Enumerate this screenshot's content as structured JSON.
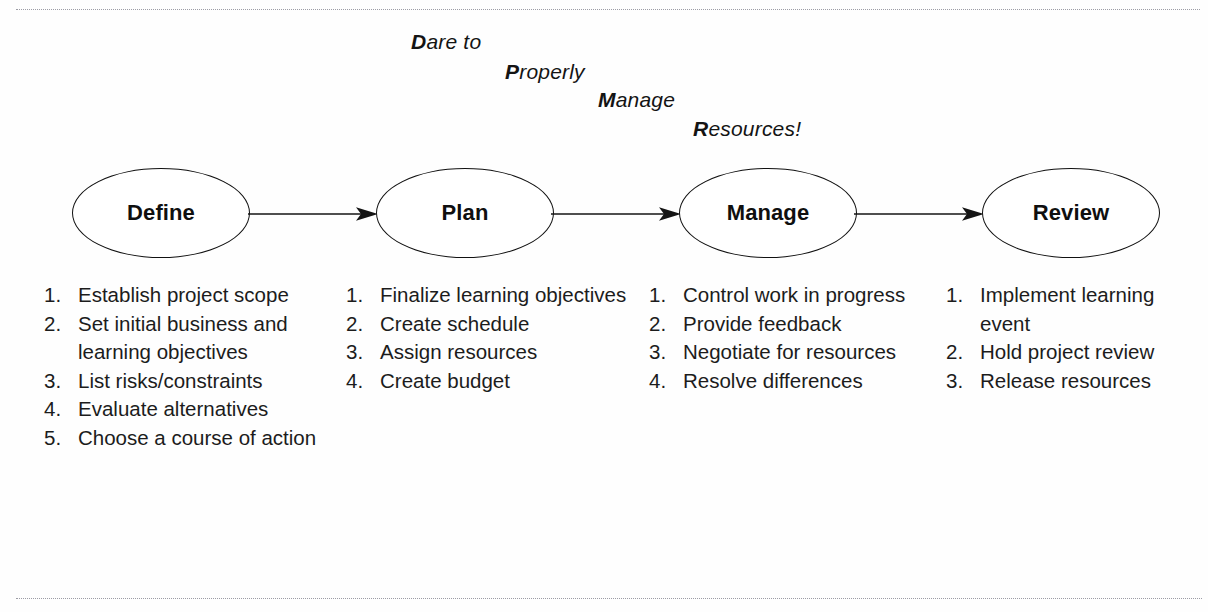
{
  "mnemonic": {
    "lines": [
      {
        "initial": "D",
        "rest": "are to"
      },
      {
        "initial": "P",
        "rest": "roperly"
      },
      {
        "initial": "M",
        "rest": "anage"
      },
      {
        "initial": "R",
        "rest": "esources!"
      }
    ]
  },
  "flow": {
    "nodes": [
      {
        "label": "Define"
      },
      {
        "label": "Plan"
      },
      {
        "label": "Manage"
      },
      {
        "label": "Review"
      }
    ],
    "arrows": [
      "arrow-define-to-plan",
      "arrow-plan-to-manage",
      "arrow-manage-to-review"
    ]
  },
  "columns": [
    {
      "phase": "Define",
      "items": [
        {
          "num": "1.",
          "text": "Establish project scope"
        },
        {
          "num": "2.",
          "text": "Set initial business and learning objectives"
        },
        {
          "num": "3.",
          "text": "List risks/constraints"
        },
        {
          "num": "4.",
          "text": "Evaluate alternatives"
        },
        {
          "num": "5.",
          "text": "Choose a course of action"
        }
      ]
    },
    {
      "phase": "Plan",
      "items": [
        {
          "num": "1.",
          "text": "Finalize learning objectives"
        },
        {
          "num": "2.",
          "text": "Create schedule"
        },
        {
          "num": "3.",
          "text": "Assign resources"
        },
        {
          "num": "4.",
          "text": "Create budget"
        }
      ]
    },
    {
      "phase": "Manage",
      "items": [
        {
          "num": "1.",
          "text": "Control work in progress"
        },
        {
          "num": "2.",
          "text": "Provide feedback"
        },
        {
          "num": "3.",
          "text": "Negotiate for resources"
        },
        {
          "num": "4.",
          "text": "Resolve differences"
        }
      ]
    },
    {
      "phase": "Review",
      "items": [
        {
          "num": "1.",
          "text": "Implement learning event"
        },
        {
          "num": "2.",
          "text": "Hold project review"
        },
        {
          "num": "3.",
          "text": "Release resources"
        }
      ]
    }
  ],
  "colors": {
    "background": "#fefefe",
    "ink": "#111111",
    "rule": "#8c8c96"
  }
}
